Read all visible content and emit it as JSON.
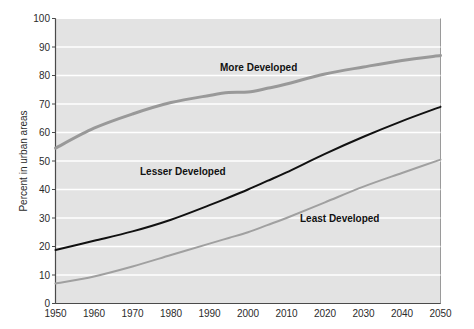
{
  "chart_data": {
    "type": "line",
    "title": "",
    "subtitle": "",
    "xlabel": "",
    "ylabel": "Percent in urban areas",
    "xlim": [
      1950,
      2050
    ],
    "ylim": [
      0,
      100
    ],
    "xticks": [
      1950,
      1960,
      1970,
      1980,
      1990,
      2000,
      2010,
      2020,
      2030,
      2040,
      2050
    ],
    "yticks": [
      0,
      10,
      20,
      30,
      40,
      50,
      60,
      70,
      80,
      90,
      100
    ],
    "grid": "horizontal-white-gridlines",
    "legend_position": "inline-annotations",
    "plot_background": "#e3e3e3",
    "gridline_color": "#ffffff",
    "x": [
      1950,
      1960,
      1970,
      1980,
      1990,
      1995,
      2000,
      2005,
      2010,
      2020,
      2030,
      2040,
      2050
    ],
    "series": [
      {
        "name": "More Developed",
        "color": "#999999",
        "line_width": 3,
        "label_text": "More Developed",
        "values": [
          54.5,
          61.5,
          66.5,
          70.5,
          73.0,
          74.0,
          74.2,
          75.5,
          77.0,
          80.5,
          83.0,
          85.3,
          87.0
        ]
      },
      {
        "name": "Lesser Developed",
        "color": "#111111",
        "line_width": 2,
        "label_text": "Lesser Developed",
        "values": [
          18.8,
          22.0,
          25.3,
          29.4,
          34.5,
          37.2,
          40.0,
          43.0,
          46.0,
          52.5,
          58.5,
          64.0,
          69.0
        ]
      },
      {
        "name": "Least Developed",
        "color": "#a0a0a0",
        "line_width": 2,
        "label_text": "Least Developed",
        "values": [
          7.0,
          9.5,
          13.0,
          17.0,
          21.0,
          23.0,
          25.0,
          27.5,
          30.0,
          35.5,
          41.0,
          45.8,
          50.5
        ]
      }
    ],
    "annotations": [
      {
        "text": "More Developed",
        "x": 2002,
        "y": 82
      },
      {
        "text": "Lesser Developed",
        "x": 1976,
        "y": 43
      },
      {
        "text": "Least Developed",
        "x": 2023,
        "y": 27
      }
    ]
  },
  "axis": {
    "y_title": "Percent in urban areas",
    "y_tick_0": "0",
    "y_tick_10": "10",
    "y_tick_20": "20",
    "y_tick_30": "30",
    "y_tick_40": "40",
    "y_tick_50": "50",
    "y_tick_60": "60",
    "y_tick_70": "70",
    "y_tick_80": "80",
    "y_tick_90": "90",
    "y_tick_100": "100",
    "x_tick_1950": "1950",
    "x_tick_1960": "1960",
    "x_tick_1970": "1970",
    "x_tick_1980": "1980",
    "x_tick_1990": "1990",
    "x_tick_2000": "2000",
    "x_tick_2010": "2010",
    "x_tick_2020": "2020",
    "x_tick_2030": "2030",
    "x_tick_2040": "2040",
    "x_tick_2050": "2050"
  },
  "labels": {
    "more_developed": "More Developed",
    "lesser_developed": "Lesser Developed",
    "least_developed": "Least Developed"
  }
}
